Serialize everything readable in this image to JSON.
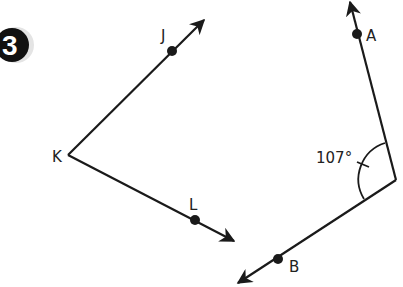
{
  "problem_number": "3",
  "figure1": {
    "vertex": {
      "label": "K",
      "x": 68,
      "y": 155
    },
    "ray1": {
      "point_label": "J",
      "point": [
        172,
        51
      ],
      "tip": [
        205,
        19
      ]
    },
    "ray2": {
      "point_label": "L",
      "point": [
        195,
        220
      ],
      "tip": [
        235,
        242
      ]
    }
  },
  "figure2": {
    "vertex": {
      "x": 396,
      "y": 180
    },
    "ray1": {
      "point_label": "A",
      "point": [
        357,
        34
      ],
      "tip": [
        350,
        1
      ]
    },
    "ray2": {
      "point_label": "B",
      "point": [
        278,
        259
      ],
      "tip": [
        237,
        284
      ]
    },
    "angle_label": "107°"
  },
  "colors": {
    "ink": "#1a1a1a",
    "badge": "#111111"
  }
}
